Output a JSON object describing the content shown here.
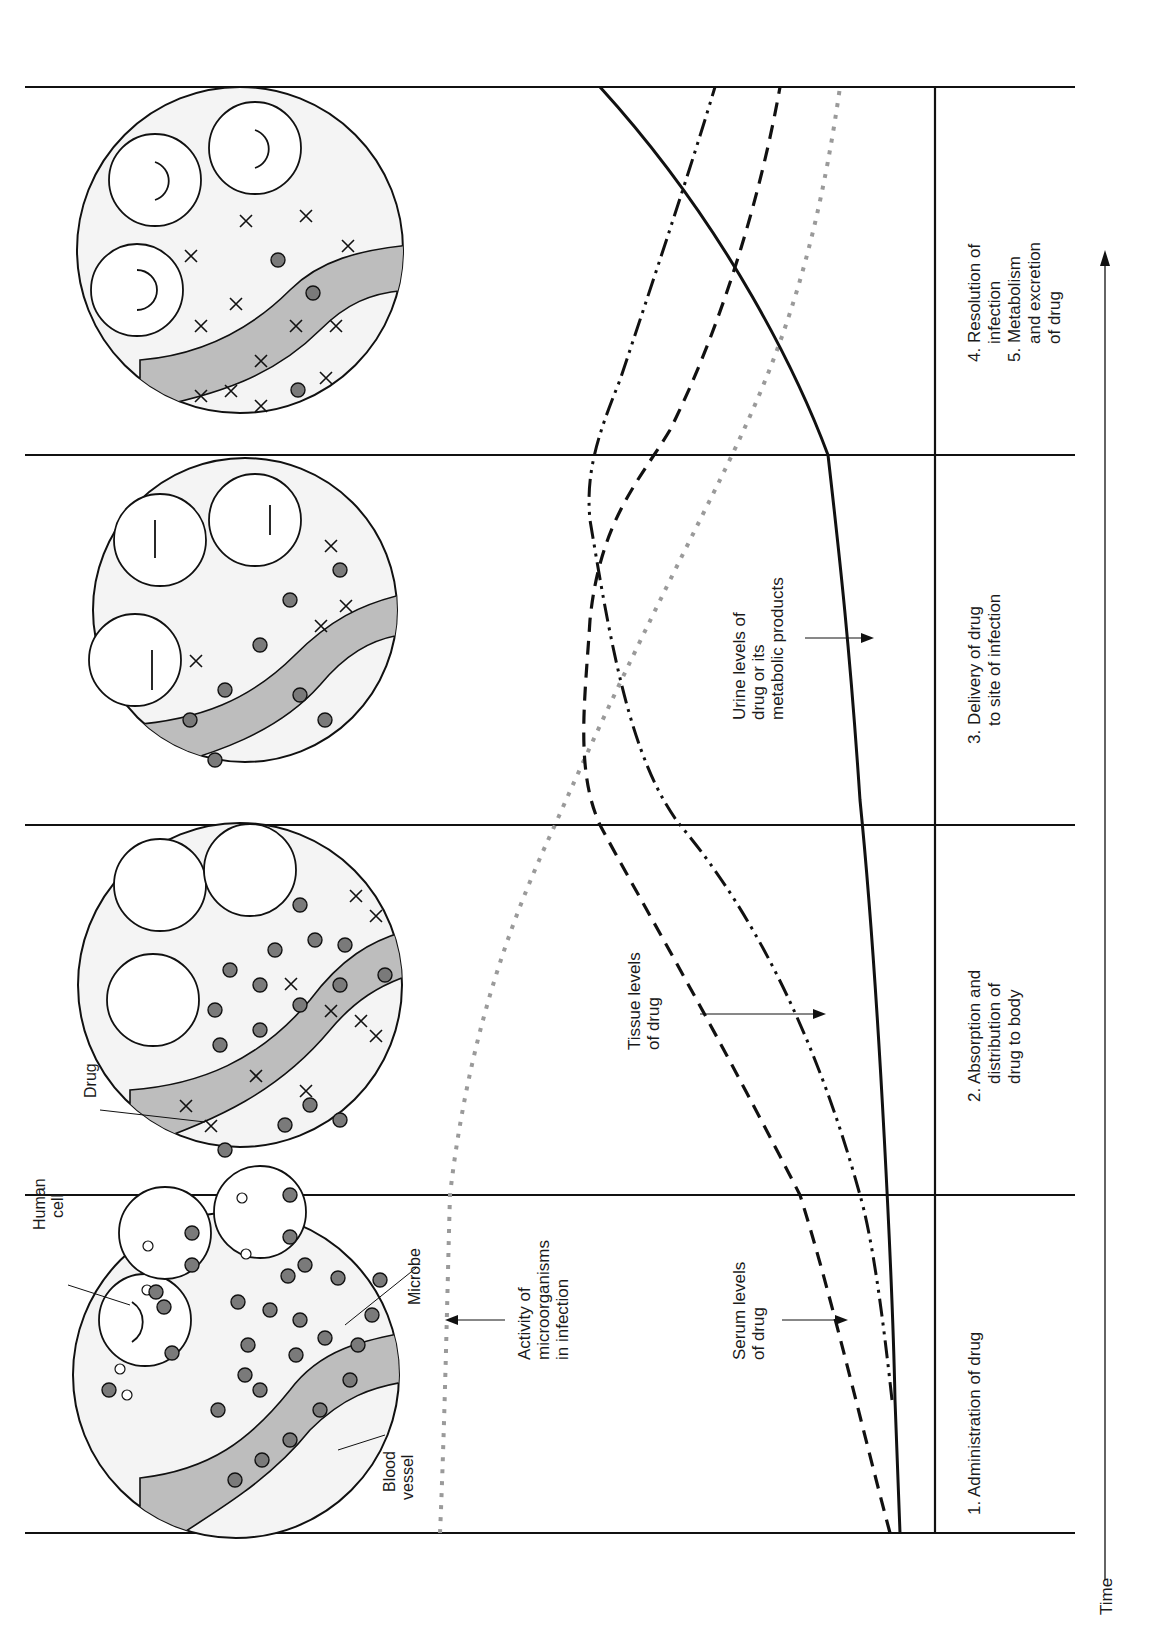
{
  "diagram": {
    "orientation": "rotated-90-ccw",
    "time_axis_label": "Time",
    "stages": [
      {
        "id": 1,
        "label_lines": [
          "1. Administration of drug"
        ]
      },
      {
        "id": 2,
        "label_lines": [
          "2. Absorption and",
          "distribution of",
          "drug to body"
        ]
      },
      {
        "id": 3,
        "label_lines": [
          "3. Delivery of drug",
          "to site of infection"
        ]
      },
      {
        "id": 4,
        "label_lines": [
          "4. Resolution of",
          "infection",
          "5. Metabolism",
          "and excretion",
          "of drug"
        ]
      }
    ],
    "panel_callouts": {
      "human_cell": [
        "Human",
        "cell"
      ],
      "microbe": "Microbe",
      "blood_vessel": [
        "Blood",
        "vessel"
      ],
      "drug": "Drug"
    },
    "curves": [
      {
        "name": "activity-of-microorganisms",
        "label_lines": [
          "Activity of",
          "microorganisms",
          "in infection"
        ],
        "style": "gray-dotted",
        "color": "#9a9a9a"
      },
      {
        "name": "serum-levels",
        "label_lines": [
          "Serum levels",
          "of drug"
        ],
        "style": "dashed",
        "color": "#111111"
      },
      {
        "name": "tissue-levels",
        "label_lines": [
          "Tissue levels",
          "of drug"
        ],
        "style": "dash-dot",
        "color": "#111111"
      },
      {
        "name": "urine-levels",
        "label_lines": [
          "Urine levels of",
          "drug or its",
          "metabolic products"
        ],
        "style": "solid",
        "color": "#111111"
      }
    ],
    "legend_colors": {
      "vessel_fill": "#bdbdbd",
      "microbe_fill": "#7a7a7a",
      "panel_bg": "#f4f4f4"
    }
  }
}
